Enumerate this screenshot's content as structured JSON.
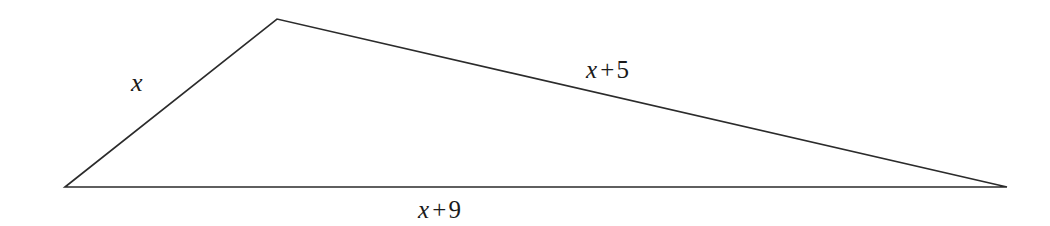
{
  "figure": {
    "type": "geometry-diagram",
    "shape": "triangle",
    "background_color": "#ffffff",
    "stroke_color": "#2b2b2b",
    "stroke_width": 1.6,
    "width": 1050,
    "height": 226
  },
  "geometry": {
    "vertices": [
      {
        "name": "left-vertex",
        "x": 65,
        "y": 187
      },
      {
        "name": "apex-vertex",
        "x": 277,
        "y": 19
      },
      {
        "name": "right-vertex",
        "x": 1007,
        "y": 187
      }
    ],
    "polygon_points": "65,187 277,19 1007,187"
  },
  "labels": {
    "side_a": {
      "name": "left-side-label",
      "text": "x",
      "variable": "x",
      "operator": "",
      "constant": "",
      "describes_side": "left-vertex-to-apex"
    },
    "side_b": {
      "name": "right-side-label",
      "text": "x + 5",
      "variable": "x",
      "operator": "+",
      "constant": "5",
      "describes_side": "apex-to-right-vertex"
    },
    "side_c": {
      "name": "base-side-label",
      "text": "x + 9",
      "variable": "x",
      "operator": "+",
      "constant": "9",
      "describes_side": "left-vertex-to-right-vertex"
    }
  }
}
